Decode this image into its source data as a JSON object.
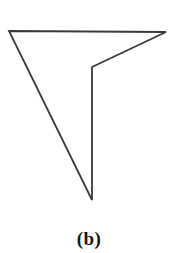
{
  "figure": {
    "caption": "(b)",
    "background_color": "#ffffff",
    "stroke_color": "#3a3a3a",
    "stroke_width": 1.8,
    "fill_color": "none",
    "shape_name": "concave-polygon-dart",
    "vertices": [
      {
        "name": "top-left",
        "x": 9,
        "y": 31
      },
      {
        "name": "top-right",
        "x": 166,
        "y": 32
      },
      {
        "name": "inner-notch",
        "x": 92,
        "y": 67
      },
      {
        "name": "bottom-tip",
        "x": 92,
        "y": 200
      }
    ],
    "edges": [
      {
        "name": "top-edge",
        "from": "top-left",
        "to": "top-right"
      },
      {
        "name": "upper-right-diagonal",
        "from": "top-right",
        "to": "inner-notch"
      },
      {
        "name": "inner-vertical",
        "from": "inner-notch",
        "to": "bottom-tip"
      },
      {
        "name": "left-diagonal",
        "from": "bottom-tip",
        "to": "top-left"
      }
    ]
  }
}
